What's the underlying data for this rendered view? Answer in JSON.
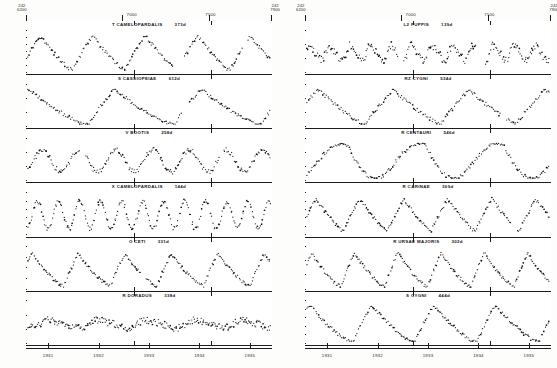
{
  "figure": {
    "background": "#ffffff",
    "ink": "#111111"
  },
  "axes": {
    "jd_prefix": "J.D.",
    "left_column": {
      "jd_start_prefix": "242",
      "jd_start": "6200",
      "jd_end_prefix": "242",
      "jd_end": "7900",
      "top_ticks": [
        "6200",
        "7000",
        "7500",
        "7900"
      ],
      "bottom_years": [
        "1931",
        "1932",
        "1933",
        "1934",
        "1935"
      ]
    },
    "right_column": {
      "jd_start_prefix": "242",
      "jd_start": "6200",
      "jd_end_prefix": "242",
      "jd_end": "7900",
      "top_ticks": [
        "6200",
        "7000",
        "7500",
        "7900"
      ],
      "bottom_years": [
        "1931",
        "1932",
        "1933",
        "1934",
        "1935"
      ]
    },
    "ylabel": "magnitude"
  },
  "chart_data": {
    "type": "scatter",
    "xlabel": "Julian Date / Year",
    "ylabel": "Visual magnitude",
    "xlim": [
      2426200,
      2427900
    ],
    "grid": false,
    "legend_position": "none",
    "panels": [
      {
        "column": "left",
        "index": 0,
        "star": "T CAMELOPARDALIS",
        "period": "373d",
        "label": "T CAMELOPARDALIS   373d",
        "ymin": 7.0,
        "ymax": 13.0,
        "yticks": [
          "7",
          "8",
          "9",
          "10",
          "11",
          "12",
          "13"
        ],
        "cycles": 4.6,
        "amplitude": 0.78,
        "phase": 0.16,
        "shape": "asymmetric-peak",
        "scatter": 0.055,
        "npoints": 190,
        "gaps": [
          [
            0.6,
            0.645
          ],
          [
            0.885,
            0.905
          ]
        ]
      },
      {
        "column": "left",
        "index": 1,
        "star": "S CASSIOPEIAE",
        "period": "612d",
        "label": "S CASSIOPEIAE   612d",
        "ymin": 8.0,
        "ymax": 14.0,
        "yticks": [
          "8",
          "10",
          "12",
          "14"
        ],
        "cycles": 2.8,
        "amplitude": 0.8,
        "phase": 0.3,
        "shape": "sharp-rise-slow-fall",
        "scatter": 0.05,
        "npoints": 175,
        "gaps": [
          [
            0.635,
            0.665
          ]
        ]
      },
      {
        "column": "left",
        "index": 2,
        "star": "V BOOTIS",
        "period": "258d",
        "label": "V BOOTIS   258d",
        "ymin": 7.0,
        "ymax": 10.0,
        "yticks": [
          "7",
          "8",
          "9",
          "10"
        ],
        "cycles": 6.6,
        "amplitude": 0.5,
        "phase": 0.1,
        "shape": "sinusoidal",
        "scatter": 0.07,
        "npoints": 210,
        "gaps": [
          [
            0.215,
            0.235
          ],
          [
            0.79,
            0.805
          ]
        ]
      },
      {
        "column": "left",
        "index": 3,
        "star": "X CAMELOPARDALIS",
        "period": "144d",
        "label": "X CAMELOPARDALIS   144d",
        "ymin": 8.0,
        "ymax": 13.0,
        "yticks": [
          "8",
          "9",
          "10",
          "11",
          "12",
          "13"
        ],
        "cycles": 11.5,
        "amplitude": 0.62,
        "phase": 0.05,
        "shape": "sinusoidal",
        "scatter": 0.065,
        "npoints": 230,
        "gaps": []
      },
      {
        "column": "left",
        "index": 4,
        "star": "O CETI",
        "period": "331d",
        "label": "O CETI   331d",
        "ymin": 2.0,
        "ymax": 10.0,
        "yticks": [
          "2",
          "4",
          "6",
          "8",
          "10"
        ],
        "cycles": 5.2,
        "amplitude": 0.74,
        "phase": 0.22,
        "shape": "sharp-rise-slow-fall",
        "scatter": 0.05,
        "npoints": 205,
        "gaps": [
          [
            0.47,
            0.49
          ]
        ]
      },
      {
        "column": "left",
        "index": 5,
        "star": "R DORADUS",
        "period": "338d",
        "label": "R DORADUS   338d",
        "ymin": 4.0,
        "ymax": 7.0,
        "yticks": [
          "4",
          "5",
          "6",
          "7"
        ],
        "cycles": 5.0,
        "amplitude": 0.22,
        "phase": 0.0,
        "shape": "irregular-low-amplitude",
        "scatter": 0.1,
        "npoints": 250,
        "gaps": []
      },
      {
        "column": "right",
        "index": 0,
        "star": "L2 PUPPIS",
        "period": "139d",
        "label": "L2 PUPPIS   139d",
        "ymin": 3.0,
        "ymax": 6.0,
        "yticks": [
          "3",
          "4",
          "5",
          "6"
        ],
        "cycles": 11.8,
        "amplitude": 0.42,
        "phase": 0.35,
        "shape": "irregular-low-amplitude",
        "scatter": 0.11,
        "npoints": 245,
        "gaps": [
          [
            0.375,
            0.4
          ],
          [
            0.7,
            0.735
          ]
        ]
      },
      {
        "column": "right",
        "index": 1,
        "star": "RZ CYGNI",
        "period": "534d",
        "label": "RZ CYGNI   534d",
        "ymin": 9.0,
        "ymax": 14.0,
        "yticks": [
          "9",
          "10",
          "12",
          "14"
        ],
        "cycles": 3.2,
        "amplitude": 0.78,
        "phase": 0.24,
        "shape": "asymmetric-peak",
        "scatter": 0.055,
        "npoints": 185,
        "gaps": [
          [
            0.8,
            0.825
          ]
        ]
      },
      {
        "column": "right",
        "index": 2,
        "star": "R CENTAURI",
        "period": "546d",
        "label": "R CENTAURI   546d",
        "ymin": 5.0,
        "ymax": 12.0,
        "yticks": [
          "5",
          "7",
          "9",
          "11"
        ],
        "cycles": 3.1,
        "amplitude": 0.8,
        "phase": 0.12,
        "shape": "double-maximum",
        "scatter": 0.055,
        "npoints": 190,
        "gaps": []
      },
      {
        "column": "right",
        "index": 3,
        "star": "R CARINAE",
        "period": "309d",
        "label": "R CARINAE   309d",
        "ymin": 4.0,
        "ymax": 9.0,
        "yticks": [
          "4",
          "5",
          "6",
          "7",
          "8",
          "9"
        ],
        "cycles": 5.5,
        "amplitude": 0.72,
        "phase": 0.18,
        "shape": "asymmetric-peak",
        "scatter": 0.05,
        "npoints": 215,
        "gaps": [
          [
            0.845,
            0.865
          ]
        ]
      },
      {
        "column": "right",
        "index": 4,
        "star": "R URSAE MAJORIS",
        "period": "302d",
        "label": "R URSAE MAJORIS   302d",
        "ymin": 6.0,
        "ymax": 13.0,
        "yticks": [
          "6",
          "8",
          "10",
          "12"
        ],
        "cycles": 5.6,
        "amplitude": 0.76,
        "phase": 0.2,
        "shape": "sharp-rise-slow-fall",
        "scatter": 0.05,
        "npoints": 210,
        "gaps": []
      },
      {
        "column": "right",
        "index": 5,
        "star": "S CYGNI",
        "period": "444d",
        "label": "S CYGNI   444d",
        "ymin": 9.0,
        "ymax": 14.0,
        "yticks": [
          "9",
          "10",
          "11",
          "12",
          "13",
          "14"
        ],
        "cycles": 3.9,
        "amplitude": 0.84,
        "phase": 0.26,
        "shape": "sharp-rise-slow-fall",
        "scatter": 0.05,
        "npoints": 195,
        "gaps": []
      }
    ]
  }
}
